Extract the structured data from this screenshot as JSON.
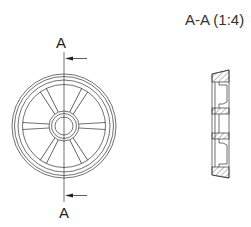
{
  "drawing": {
    "section_label_top": "A",
    "section_label_bottom": "A",
    "section_view_title": "A-A (1:4)",
    "front_view": {
      "name": "spoked-wheel-front-view",
      "spoke_count": 8
    },
    "section_view": {
      "name": "section-view-a-a"
    },
    "line_color": "#333333",
    "hatch_color": "#555555"
  }
}
